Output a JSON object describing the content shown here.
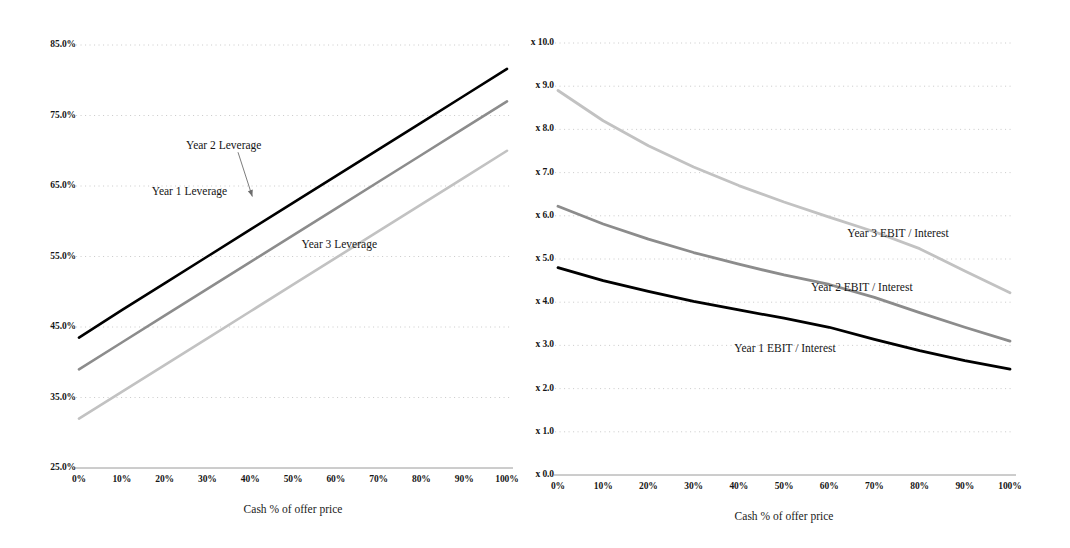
{
  "figure": {
    "background": "#ffffff",
    "width": 1070,
    "height": 548
  },
  "chart_data": [
    {
      "id": "leverage",
      "type": "line",
      "title": "",
      "xlabel": "Cash % of offer price",
      "ylabel": "",
      "xlim": [
        0,
        100
      ],
      "ylim": [
        25,
        85
      ],
      "grid": true,
      "grid_style": "dotted-horizontal",
      "legend_position": "inline-annotations",
      "x": [
        0,
        10,
        20,
        30,
        40,
        50,
        60,
        70,
        80,
        90,
        100
      ],
      "xticklabels": [
        "0%",
        "10%",
        "20%",
        "30%",
        "40%",
        "50%",
        "60%",
        "70%",
        "80%",
        "90%",
        "100%"
      ],
      "yticklabels": [
        "85.0%",
        "75.0%",
        "65.0%",
        "55.0%",
        "45.0%",
        "35.0%",
        "25.0%"
      ],
      "yticks": [
        85,
        75,
        65,
        55,
        45,
        35,
        25
      ],
      "series": [
        {
          "name": "Year 1 Leverage",
          "color": "#000000",
          "width": 2.6,
          "values": [
            43.5,
            47.4,
            51.2,
            55.0,
            58.8,
            62.6,
            66.4,
            70.2,
            74.0,
            77.8,
            81.6
          ]
        },
        {
          "name": "Year 2 Leverage",
          "color": "#8c8c8c",
          "width": 2.6,
          "values": [
            39.0,
            42.8,
            46.6,
            50.4,
            54.2,
            58.0,
            61.8,
            65.6,
            69.4,
            73.2,
            77.0
          ]
        },
        {
          "name": "Year 3 Leverage",
          "color": "#c2c2c2",
          "width": 2.6,
          "values": [
            32.0,
            35.8,
            39.6,
            43.4,
            47.2,
            51.0,
            54.8,
            58.6,
            62.4,
            66.2,
            70.0
          ]
        }
      ],
      "annotations": [
        {
          "text": "Year 1 Leverage",
          "x": 17,
          "y": 64.0,
          "arrow": false
        },
        {
          "text": "Year 2 Leverage",
          "x": 25,
          "y": 70.5,
          "arrow": true,
          "arrow_to_x": 40.5,
          "arrow_to_y": 63.5
        },
        {
          "text": "Year 3 Leverage",
          "x": 52,
          "y": 56.5,
          "arrow": false
        }
      ]
    },
    {
      "id": "coverage",
      "type": "line",
      "title": "",
      "xlabel": "Cash % of offer price",
      "ylabel": "",
      "xlim": [
        0,
        100
      ],
      "ylim": [
        0,
        10
      ],
      "grid": true,
      "grid_style": "dotted-horizontal",
      "legend_position": "inline-annotations",
      "x": [
        0,
        10,
        20,
        30,
        40,
        50,
        60,
        70,
        80,
        90,
        100
      ],
      "xticklabels": [
        "0%",
        "10%",
        "20%",
        "30%",
        "40%",
        "50%",
        "60%",
        "70%",
        "80%",
        "90%",
        "100%"
      ],
      "yticklabels": [
        "x 10.0",
        "x 9.0",
        "x 8.0",
        "x 7.0",
        "x 6.0",
        "x 5.0",
        "x 4.0",
        "x 3.0",
        "x 2.0",
        "x 1.0",
        "x 0.0"
      ],
      "yticks": [
        10,
        9,
        8,
        7,
        6,
        5,
        4,
        3,
        2,
        1,
        0
      ],
      "series": [
        {
          "name": "Year 3 EBIT / Interest",
          "color": "#c2c2c2",
          "width": 2.8,
          "values": [
            8.9,
            8.2,
            7.62,
            7.13,
            6.7,
            6.32,
            5.97,
            5.63,
            5.24,
            4.72,
            4.22
          ]
        },
        {
          "name": "Year 2 EBIT / Interest",
          "color": "#8c8c8c",
          "width": 2.8,
          "values": [
            6.22,
            5.81,
            5.46,
            5.15,
            4.88,
            4.63,
            4.41,
            4.11,
            3.76,
            3.42,
            3.1
          ]
        },
        {
          "name": "Year 1 EBIT / Interest",
          "color": "#000000",
          "width": 2.8,
          "values": [
            4.8,
            4.5,
            4.25,
            4.02,
            3.82,
            3.63,
            3.42,
            3.14,
            2.88,
            2.65,
            2.45
          ]
        }
      ],
      "annotations": [
        {
          "text": "Year 3 EBIT / Interest",
          "x": 64,
          "y": 5.55,
          "arrow": false
        },
        {
          "text": "Year 2 EBIT / Interest",
          "x": 56,
          "y": 4.3,
          "arrow": false
        },
        {
          "text": "Year 1 EBIT / Interest",
          "x": 39,
          "y": 2.9,
          "arrow": false
        }
      ]
    }
  ],
  "colors": {
    "axis": "#9a9a9a",
    "grid": "#c8c8c8",
    "text": "#161616",
    "series_dark": "#000000",
    "series_mid": "#8c8c8c",
    "series_light": "#c2c2c2"
  }
}
